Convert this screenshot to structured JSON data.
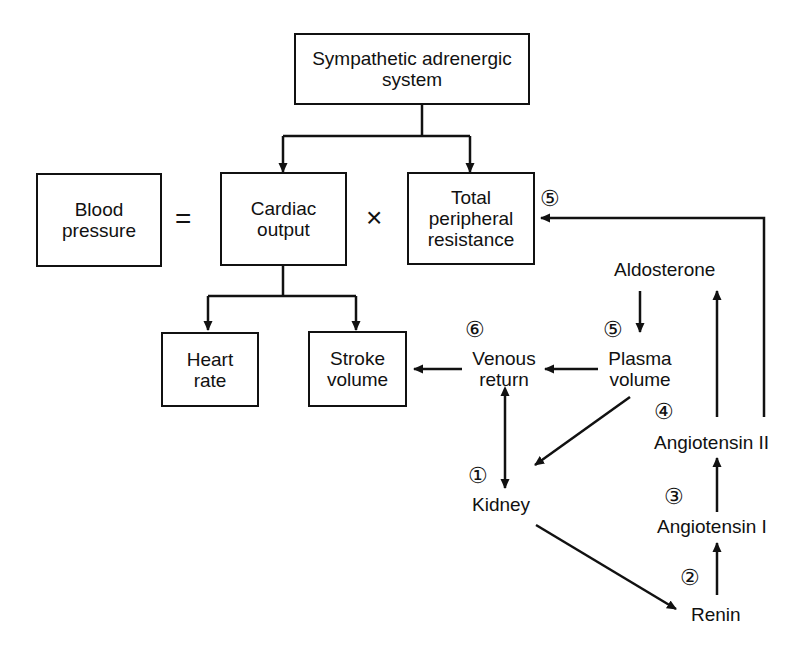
{
  "diagram": {
    "nodes": {
      "sympathetic": "Sympathetic adrenergic system",
      "sympathetic_line1": "Sympathetic adrenergic",
      "sympathetic_line2": "system",
      "blood_pressure_line1": "Blood",
      "blood_pressure_line2": "pressure",
      "cardiac_output_line1": "Cardiac",
      "cardiac_output_line2": "output",
      "tpr_line1": "Total",
      "tpr_line2": "peripheral",
      "tpr_line3": "resistance",
      "heart_rate_line1": "Heart",
      "heart_rate_line2": "rate",
      "stroke_volume_line1": "Stroke",
      "stroke_volume_line2": "volume",
      "venous_return_line1": "Venous",
      "venous_return_line2": "return",
      "plasma_volume_line1": "Plasma",
      "plasma_volume_line2": "volume",
      "aldosterone": "Aldosterone",
      "angiotensin_ii": "Angiotensin II",
      "angiotensin_i": "Angiotensin I",
      "kidney": "Kidney",
      "renin": "Renin"
    },
    "operators": {
      "equals": "=",
      "times": "×"
    },
    "step_markers": {
      "tpr": "⑤",
      "plasma_volume": "⑤",
      "venous_return": "⑥",
      "kidney": "①",
      "renin": "②",
      "angiotensin_i": "③",
      "angiotensin_ii": "④"
    },
    "edges": [
      {
        "from": "Sympathetic adrenergic system",
        "to": "Cardiac output"
      },
      {
        "from": "Sympathetic adrenergic system",
        "to": "Total peripheral resistance"
      },
      {
        "from": "Cardiac output",
        "to": "Heart rate"
      },
      {
        "from": "Cardiac output",
        "to": "Stroke volume"
      },
      {
        "from": "Venous return",
        "to": "Stroke volume"
      },
      {
        "from": "Plasma volume",
        "to": "Venous return"
      },
      {
        "from": "Aldosterone",
        "to": "Plasma volume"
      },
      {
        "from": "Plasma volume",
        "to": "Kidney"
      },
      {
        "from": "Venous return",
        "to": "Kidney",
        "bidirectional": true
      },
      {
        "from": "Kidney",
        "to": "Renin"
      },
      {
        "from": "Renin",
        "to": "Angiotensin I"
      },
      {
        "from": "Angiotensin I",
        "to": "Angiotensin II"
      },
      {
        "from": "Angiotensin II",
        "to": "Aldosterone"
      },
      {
        "from": "Angiotensin II",
        "to": "Total peripheral resistance"
      }
    ],
    "colors": {
      "ink": "#111111",
      "background": "#ffffff"
    }
  }
}
